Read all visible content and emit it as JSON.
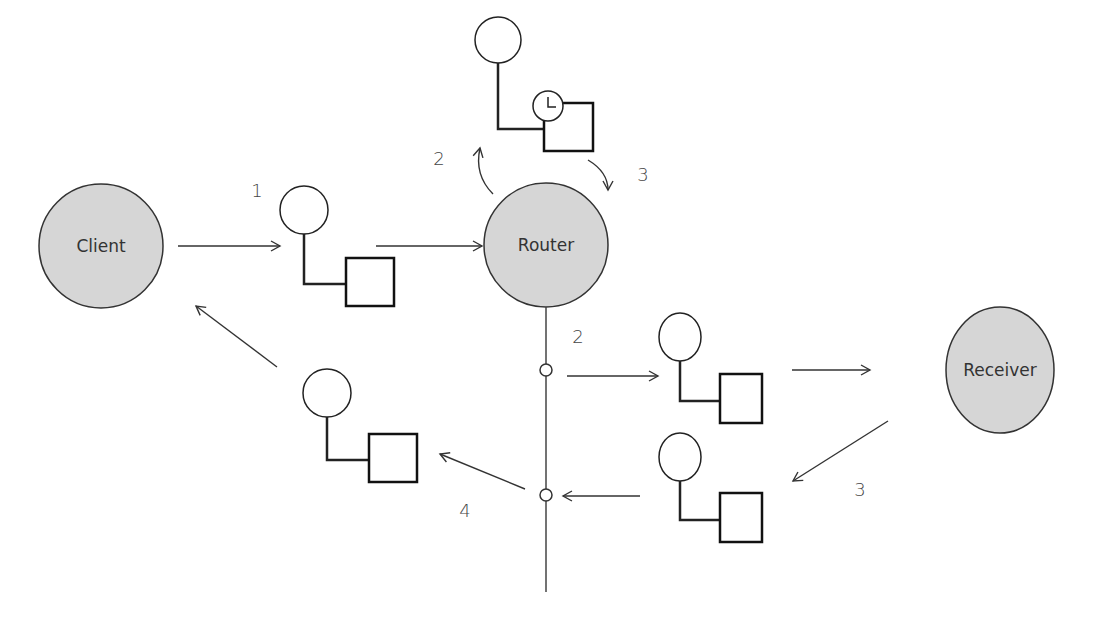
{
  "diagram": {
    "nodes": {
      "client": {
        "label": "Client"
      },
      "router": {
        "label": "Router"
      },
      "receiver": {
        "label": "Receiver"
      }
    },
    "steps": {
      "step_1": "1",
      "step_2_up": "2",
      "step_3_down": "3",
      "step_2_bus": "2",
      "step_3_receiver": "3",
      "step_4": "4"
    },
    "icons": {
      "packet": "packet-icon",
      "clock": "clock-icon"
    },
    "colors": {
      "node_fill": "#d6d6d6",
      "stroke": "#333333",
      "hatch": "#111111",
      "background": "#ffffff"
    }
  }
}
